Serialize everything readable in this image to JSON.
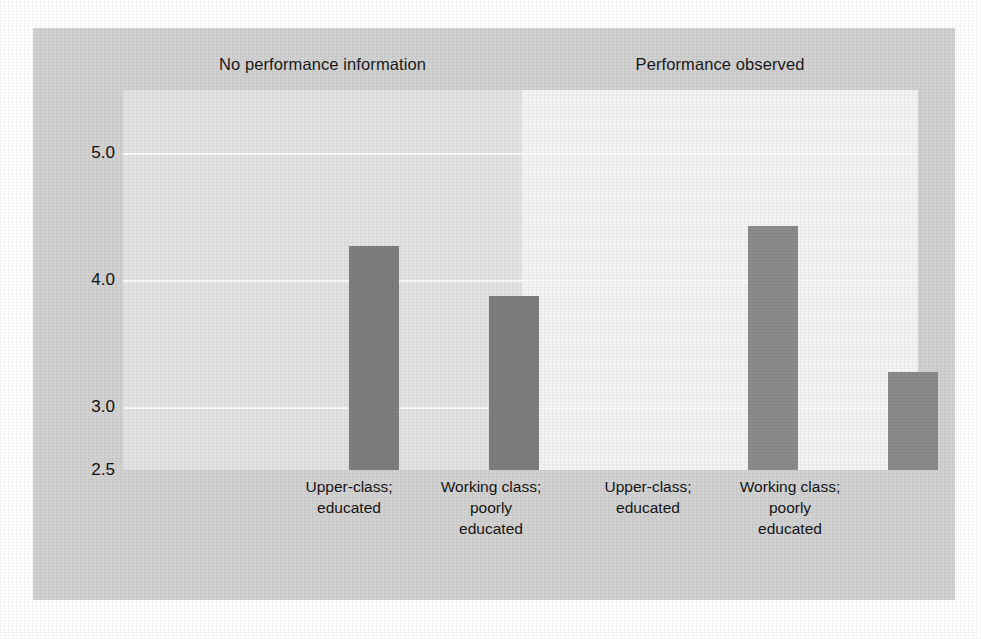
{
  "chart_data": {
    "type": "bar",
    "title": "",
    "subtitle": "",
    "xlabel": "",
    "ylabel": "",
    "ylim": [
      2.5,
      5.5
    ],
    "grid": true,
    "legend_position": "none",
    "panels": [
      {
        "title": "No performance information",
        "categories": [
          "Upper-class;\neducated",
          "Working class;\npoorly\neducated"
        ],
        "values": [
          4.27,
          3.87
        ]
      },
      {
        "title": "Performance observed",
        "categories": [
          "Upper-class;\neducated",
          "Working class;\npoorly\neducated"
        ],
        "values": [
          4.43,
          3.27
        ]
      }
    ],
    "yticks": [
      {
        "label": "5.0",
        "value": 5.0
      },
      {
        "label": "4.0",
        "value": 4.0
      },
      {
        "label": "3.0",
        "value": 3.0
      },
      {
        "label": "2.5",
        "value": 2.5
      }
    ],
    "gridlines": [
      5.0,
      4.0,
      3.0
    ],
    "bar_color_left": "#7e7e7e",
    "bar_color_right": "#8b8b8b",
    "panel_bg_left": "#e3e3e3",
    "panel_bg_right": "#f4f4f4",
    "figure_bg": "#d2d2d2"
  },
  "panels": {
    "left": {
      "title": "No performance information",
      "bars": [
        {
          "label_line1": "Upper-class;",
          "label_line2": "educated",
          "label_line3": ""
        },
        {
          "label_line1": "Working class;",
          "label_line2": "poorly",
          "label_line3": "educated"
        }
      ]
    },
    "right": {
      "title": "Performance observed",
      "bars": [
        {
          "label_line1": "Upper-class;",
          "label_line2": "educated",
          "label_line3": ""
        },
        {
          "label_line1": "Working class;",
          "label_line2": "poorly",
          "label_line3": "educated"
        }
      ]
    }
  },
  "axis": {
    "y": {
      "tick_labels": [
        "5.0",
        "4.0",
        "3.0",
        "2.5"
      ]
    }
  }
}
